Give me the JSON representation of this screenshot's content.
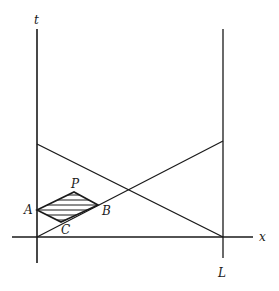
{
  "diagram": {
    "axes": {
      "t_label": "t",
      "x_label": "x",
      "L_label": "L"
    },
    "points": {
      "A": "A",
      "P": "P",
      "B": "B",
      "C": "C"
    },
    "colors": {
      "stroke": "#1a1a1a",
      "background": "#ffffff"
    }
  }
}
